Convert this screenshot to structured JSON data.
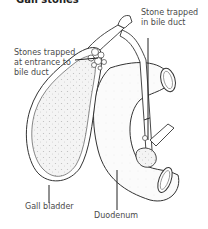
{
  "title": "Gall stones",
  "labels": {
    "stones_entrance": [
      "Stones trapped",
      "at entrance to",
      "bile duct"
    ],
    "stone_bile_duct": [
      "Stone trapped",
      "in bile duct"
    ],
    "gall_bladder": "Gall bladder",
    "duodenum": "Duodenum"
  }
}
